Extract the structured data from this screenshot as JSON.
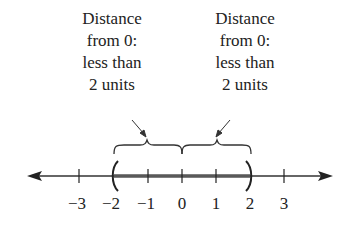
{
  "callouts": [
    {
      "lines": [
        "Distance",
        "from 0:",
        "less than",
        "2 units"
      ]
    },
    {
      "lines": [
        "Distance",
        "from 0:",
        "less than",
        "2 units"
      ]
    }
  ],
  "number_line": {
    "ticks": [
      {
        "value": -3,
        "label": "−3"
      },
      {
        "value": -2,
        "label": "−2"
      },
      {
        "value": -1,
        "label": "−1"
      },
      {
        "value": 0,
        "label": "0"
      },
      {
        "value": 1,
        "label": "1"
      },
      {
        "value": 2,
        "label": "2"
      },
      {
        "value": 3,
        "label": "3"
      }
    ],
    "interval": {
      "start": -2,
      "end": 2,
      "open_start": true,
      "open_end": true
    }
  }
}
